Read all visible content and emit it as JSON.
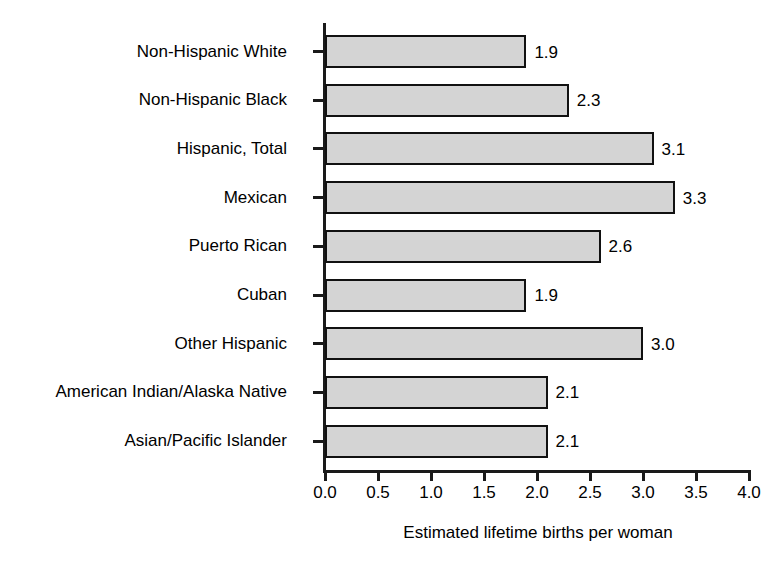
{
  "chart_data": {
    "type": "bar",
    "orientation": "horizontal",
    "title": "",
    "xlabel": "Estimated lifetime births per woman",
    "ylabel": "",
    "xlim": [
      0.0,
      4.0
    ],
    "xticks": [
      "0.0",
      "0.5",
      "1.0",
      "1.5",
      "2.0",
      "2.5",
      "3.0",
      "3.5",
      "4.0"
    ],
    "xtick_values": [
      0.0,
      0.5,
      1.0,
      1.5,
      2.0,
      2.5,
      3.0,
      3.5,
      4.0
    ],
    "grid": false,
    "legend": false,
    "categories": [
      "Non-Hispanic White",
      "Non-Hispanic Black",
      "Hispanic, Total",
      "Mexican",
      "Puerto Rican",
      "Cuban",
      "Other Hispanic",
      "American Indian/Alaska Native",
      "Asian/Pacific Islander"
    ],
    "values": [
      1.9,
      2.3,
      3.1,
      3.3,
      2.6,
      1.9,
      3.0,
      2.1,
      2.1
    ],
    "value_labels": [
      "1.9",
      "2.3",
      "3.1",
      "3.3",
      "2.6",
      "1.9",
      "3.0",
      "2.1",
      "2.1"
    ],
    "bar_fill_color": "#d4d4d4",
    "bar_edge_color": "#111111",
    "axis_color": "#1a1a1a",
    "background_color": "#ffffff"
  }
}
